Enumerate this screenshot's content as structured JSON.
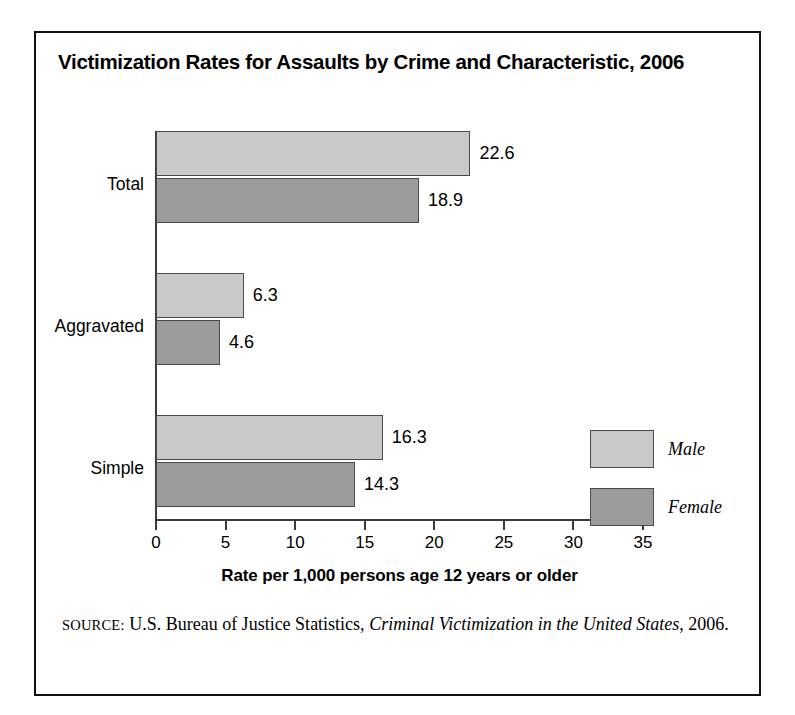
{
  "chart_data": {
    "type": "bar",
    "orientation": "horizontal",
    "grouping": "grouped",
    "title": "Victimization Rates for Assaults by Crime and Characteristic, 2006",
    "categories": [
      "Total",
      "Aggravated",
      "Simple"
    ],
    "series": [
      {
        "name": "Male",
        "values": [
          22.6,
          6.3,
          16.3
        ],
        "color": "#c9c9c9"
      },
      {
        "name": "Female",
        "values": [
          18.9,
          4.6,
          14.3
        ],
        "color": "#9c9c9c"
      }
    ],
    "value_labels": {
      "Total": {
        "Male": "22.6",
        "Female": "18.9"
      },
      "Aggravated": {
        "Male": "6.3",
        "Female": "4.6"
      },
      "Simple": {
        "Male": "16.3",
        "Female": "14.3"
      }
    },
    "xlabel": "Rate per 1,000 persons age 12 years or older",
    "ylabel": "",
    "xlim": [
      0,
      35
    ],
    "xticks": [
      0,
      5,
      10,
      15,
      20,
      25,
      30,
      35
    ],
    "xtick_labels": [
      "0",
      "5",
      "10",
      "15",
      "20",
      "25",
      "30",
      "35"
    ],
    "grid": false,
    "legend_position": "right-middle",
    "legend_entries": [
      "Male",
      "Female"
    ]
  },
  "title": "Victimization Rates for Assaults by Crime and Characteristic, 2006",
  "axis": {
    "x_title": "Rate per 1,000 persons age 12 years or older",
    "ticks": [
      {
        "label": "0",
        "value": 0
      },
      {
        "label": "5",
        "value": 5
      },
      {
        "label": "10",
        "value": 10
      },
      {
        "label": "15",
        "value": 15
      },
      {
        "label": "20",
        "value": 20
      },
      {
        "label": "25",
        "value": 25
      },
      {
        "label": "30",
        "value": 30
      },
      {
        "label": "35",
        "value": 35
      }
    ]
  },
  "groups": [
    {
      "label": "Total",
      "bars": [
        {
          "series": "Male",
          "value": 22.6,
          "label": "22.6"
        },
        {
          "series": "Female",
          "value": 18.9,
          "label": "18.9"
        }
      ]
    },
    {
      "label": "Aggravated",
      "bars": [
        {
          "series": "Male",
          "value": 6.3,
          "label": "6.3"
        },
        {
          "series": "Female",
          "value": 4.6,
          "label": "4.6"
        }
      ]
    },
    {
      "label": "Simple",
      "bars": [
        {
          "series": "Male",
          "value": 16.3,
          "label": "16.3"
        },
        {
          "series": "Female",
          "value": 14.3,
          "label": "14.3"
        }
      ]
    }
  ],
  "legend": {
    "items": [
      {
        "label": "Male",
        "color": "#c9c9c9"
      },
      {
        "label": "Female",
        "color": "#9c9c9c"
      }
    ]
  },
  "source": {
    "label": "SOURCE:",
    "text_before": " U.S. Bureau of Justice Statistics, ",
    "italic_title": "Criminal Victimization in the United States",
    "text_after": ", 2006."
  },
  "colors": {
    "male_fill": "#c9c9c9",
    "female_fill": "#9c9c9c",
    "bar_stroke": "#4a4a4a",
    "axis": "#3a3a3a",
    "frame": "#111111",
    "text": "#000000"
  }
}
